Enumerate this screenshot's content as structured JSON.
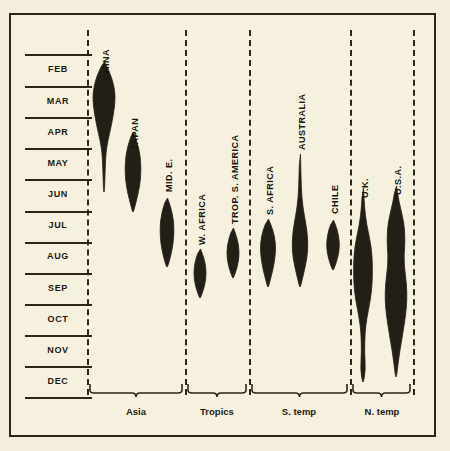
{
  "chart_data": {
    "type": "area",
    "chart_kind": "violin-distribution-strips",
    "title": "",
    "xlabel": "",
    "ylabel": "",
    "axis": {
      "y_tick_labels": [
        "FEB",
        "MAR",
        "APR",
        "MAY",
        "JUN",
        "JUL",
        "AUG",
        "SEP",
        "OCT",
        "NOV",
        "DEC"
      ],
      "y_axis_kind": "months",
      "grid": true,
      "legend": "none"
    },
    "groups": [
      {
        "label": "Asia",
        "members": [
          "CHINA",
          "JAPAN",
          "MID. E."
        ]
      },
      {
        "label": "Tropics",
        "members": [
          "W. AFRICA",
          "TROP. S. AMERICA"
        ]
      },
      {
        "label": "S. temp",
        "members": [
          "S. AFRICA",
          "AUSTRALIA",
          "CHILE"
        ]
      },
      {
        "label": "N. temp",
        "members": [
          "U.K.",
          "U.S.A."
        ]
      }
    ],
    "series": [
      {
        "name": "CHINA",
        "group": "Asia",
        "center_x": 102,
        "label_x": 99,
        "label_y": 78,
        "peak_month": "MAR",
        "start_month": "FEB",
        "end_month": "JUN",
        "profile": [
          {
            "y": 60,
            "w": 1
          },
          {
            "y": 68,
            "w": 9
          },
          {
            "y": 78,
            "w": 17
          },
          {
            "y": 90,
            "w": 22
          },
          {
            "y": 100,
            "w": 22
          },
          {
            "y": 112,
            "w": 19
          },
          {
            "y": 125,
            "w": 14
          },
          {
            "y": 138,
            "w": 8
          },
          {
            "y": 150,
            "w": 4
          },
          {
            "y": 165,
            "w": 2.5
          },
          {
            "y": 190,
            "w": 1
          }
        ]
      },
      {
        "name": "JAPAN",
        "group": "Asia",
        "center_x": 131,
        "label_x": 128,
        "label_y": 148,
        "peak_month": "MAY",
        "start_month": "APR",
        "end_month": "JUL",
        "profile": [
          {
            "y": 130,
            "w": 1
          },
          {
            "y": 140,
            "w": 8
          },
          {
            "y": 152,
            "w": 14
          },
          {
            "y": 165,
            "w": 16
          },
          {
            "y": 178,
            "w": 15
          },
          {
            "y": 190,
            "w": 11
          },
          {
            "y": 200,
            "w": 6
          },
          {
            "y": 210,
            "w": 1
          }
        ]
      },
      {
        "name": "MID. E.",
        "group": "Asia",
        "center_x": 165,
        "label_x": 162,
        "label_y": 190,
        "peak_month": "JUL",
        "start_month": "JUN",
        "end_month": "AUG",
        "profile": [
          {
            "y": 196,
            "w": 1
          },
          {
            "y": 206,
            "w": 8
          },
          {
            "y": 218,
            "w": 13
          },
          {
            "y": 230,
            "w": 14
          },
          {
            "y": 243,
            "w": 12
          },
          {
            "y": 255,
            "w": 7
          },
          {
            "y": 265,
            "w": 1
          }
        ]
      },
      {
        "name": "W. AFRICA",
        "group": "Tropics",
        "center_x": 198,
        "label_x": 195,
        "label_y": 243,
        "peak_month": "AUG",
        "start_month": "JUL",
        "end_month": "SEP",
        "profile": [
          {
            "y": 247,
            "w": 1
          },
          {
            "y": 256,
            "w": 8
          },
          {
            "y": 266,
            "w": 12
          },
          {
            "y": 276,
            "w": 12
          },
          {
            "y": 286,
            "w": 8
          },
          {
            "y": 296,
            "w": 1
          }
        ]
      },
      {
        "name": "TROP. S. AMERICA",
        "group": "Tropics",
        "center_x": 231,
        "label_x": 228,
        "label_y": 222,
        "peak_month": "AUG",
        "start_month": "JUL",
        "end_month": "SEP",
        "profile": [
          {
            "y": 226,
            "w": 1
          },
          {
            "y": 236,
            "w": 8
          },
          {
            "y": 246,
            "w": 12
          },
          {
            "y": 256,
            "w": 12
          },
          {
            "y": 266,
            "w": 8
          },
          {
            "y": 276,
            "w": 1
          }
        ]
      },
      {
        "name": "S. AFRICA",
        "group": "S. temp",
        "center_x": 266,
        "label_x": 263,
        "label_y": 213,
        "peak_month": "AUG",
        "start_month": "JUL",
        "end_month": "SEP",
        "profile": [
          {
            "y": 217,
            "w": 1
          },
          {
            "y": 228,
            "w": 10
          },
          {
            "y": 240,
            "w": 15
          },
          {
            "y": 252,
            "w": 15
          },
          {
            "y": 265,
            "w": 11
          },
          {
            "y": 275,
            "w": 6
          },
          {
            "y": 285,
            "w": 1
          }
        ]
      },
      {
        "name": "AUSTRALIA",
        "group": "S. temp",
        "center_x": 298,
        "label_x": 295,
        "label_y": 148,
        "peak_month": "AUG",
        "start_month": "MAY",
        "end_month": "SEP",
        "profile": [
          {
            "y": 152,
            "w": 1
          },
          {
            "y": 175,
            "w": 2
          },
          {
            "y": 196,
            "w": 3.5
          },
          {
            "y": 212,
            "w": 8
          },
          {
            "y": 228,
            "w": 14
          },
          {
            "y": 243,
            "w": 16
          },
          {
            "y": 256,
            "w": 14
          },
          {
            "y": 270,
            "w": 8
          },
          {
            "y": 285,
            "w": 1
          }
        ]
      },
      {
        "name": "CHILE",
        "group": "S. temp",
        "center_x": 331,
        "label_x": 328,
        "label_y": 212,
        "peak_month": "AUG",
        "start_month": "JUL",
        "end_month": "AUG",
        "profile": [
          {
            "y": 218,
            "w": 1
          },
          {
            "y": 228,
            "w": 9
          },
          {
            "y": 240,
            "w": 13
          },
          {
            "y": 250,
            "w": 12
          },
          {
            "y": 260,
            "w": 7
          },
          {
            "y": 268,
            "w": 1
          }
        ]
      },
      {
        "name": "U.K.",
        "group": "N. temp",
        "center_x": 361,
        "label_x": 358,
        "label_y": 196,
        "peak_month": "OCT",
        "start_month": "JUL",
        "end_month": "DEC",
        "profile": [
          {
            "y": 186,
            "w": 1
          },
          {
            "y": 205,
            "w": 3
          },
          {
            "y": 222,
            "w": 7
          },
          {
            "y": 238,
            "w": 14
          },
          {
            "y": 252,
            "w": 18
          },
          {
            "y": 268,
            "w": 19
          },
          {
            "y": 285,
            "w": 18
          },
          {
            "y": 300,
            "w": 14
          },
          {
            "y": 315,
            "w": 8
          },
          {
            "y": 330,
            "w": 4
          },
          {
            "y": 350,
            "w": 3
          },
          {
            "y": 368,
            "w": 5
          },
          {
            "y": 380,
            "w": 1
          }
        ]
      },
      {
        "name": "U.S.A.",
        "group": "N. temp",
        "center_x": 394,
        "label_x": 391,
        "label_y": 193,
        "peak_month": "OCT",
        "start_month": "JUL",
        "end_month": "DEC",
        "profile": [
          {
            "y": 184,
            "w": 1
          },
          {
            "y": 200,
            "w": 6
          },
          {
            "y": 214,
            "w": 13
          },
          {
            "y": 226,
            "w": 17
          },
          {
            "y": 240,
            "w": 18
          },
          {
            "y": 254,
            "w": 16
          },
          {
            "y": 266,
            "w": 17
          },
          {
            "y": 282,
            "w": 21
          },
          {
            "y": 298,
            "w": 22
          },
          {
            "y": 314,
            "w": 19
          },
          {
            "y": 330,
            "w": 14
          },
          {
            "y": 348,
            "w": 8
          },
          {
            "y": 362,
            "w": 4
          },
          {
            "y": 375,
            "w": 1
          }
        ]
      }
    ],
    "colors": {
      "background": "#f6f1de",
      "ink": "#2a2618",
      "violin_fill": "#231f16",
      "page_background": "#efe9d2"
    }
  },
  "months": [
    {
      "label": "FEB",
      "rule_y": 52,
      "text_y": 62
    },
    {
      "label": "MAR",
      "rule_y": 84,
      "text_y": 94
    },
    {
      "label": "APR",
      "rule_y": 115,
      "text_y": 125
    },
    {
      "label": "MAY",
      "rule_y": 146,
      "text_y": 156
    },
    {
      "label": "JUN",
      "rule_y": 177,
      "text_y": 187
    },
    {
      "label": "JUL",
      "rule_y": 209,
      "text_y": 218
    },
    {
      "label": "AUG",
      "rule_y": 240,
      "text_y": 249
    },
    {
      "label": "SEP",
      "rule_y": 271,
      "text_y": 281
    },
    {
      "label": "OCT",
      "rule_y": 302,
      "text_y": 312
    },
    {
      "label": "NOV",
      "rule_y": 333,
      "text_y": 343
    },
    {
      "label": "DEC",
      "rule_y": 364,
      "text_y": 374
    },
    {
      "label": "",
      "rule_y": 395,
      "text_y": -100
    }
  ],
  "dividers": [
    85,
    183,
    247,
    348,
    411
  ],
  "group_braces": [
    {
      "label": "Asia",
      "x1": 88,
      "x2": 180,
      "label_x": 134
    },
    {
      "label": "Tropics",
      "x1": 186,
      "x2": 244,
      "label_x": 215
    },
    {
      "label": "S. temp",
      "x1": 250,
      "x2": 345,
      "label_x": 297
    },
    {
      "label": "N. temp",
      "x1": 351,
      "x2": 408,
      "label_x": 380
    }
  ]
}
